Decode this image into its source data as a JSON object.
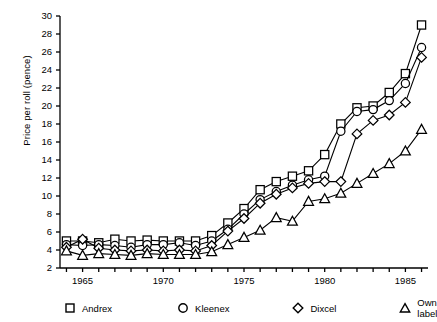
{
  "chart_data": {
    "type": "line",
    "title": "",
    "xlabel": "",
    "ylabel": "Price per roll (pence)",
    "xlim": [
      1963.6,
      1986.4
    ],
    "ylim": [
      2,
      30
    ],
    "yticks": [
      2,
      4,
      6,
      8,
      10,
      12,
      14,
      16,
      18,
      20,
      22,
      24,
      26,
      28,
      30
    ],
    "xticks": [
      1964,
      1965,
      1966,
      1967,
      1968,
      1969,
      1970,
      1971,
      1972,
      1973,
      1974,
      1975,
      1976,
      1977,
      1978,
      1979,
      1980,
      1981,
      1982,
      1983,
      1984,
      1985,
      1986
    ],
    "xtick_labels": [
      {
        "value": 1965,
        "label": "1965"
      },
      {
        "value": 1970,
        "label": "1970"
      },
      {
        "value": 1975,
        "label": "1975"
      },
      {
        "value": 1980,
        "label": "1980"
      },
      {
        "value": 1985,
        "label": "1985"
      }
    ],
    "grid": false,
    "legend_position": "below",
    "x": [
      1964,
      1965,
      1966,
      1967,
      1968,
      1969,
      1970,
      1971,
      1972,
      1973,
      1974,
      1975,
      1976,
      1977,
      1978,
      1979,
      1980,
      1981,
      1982,
      1983,
      1984,
      1985,
      1986
    ],
    "series": [
      {
        "name": "Andrex",
        "marker": "square",
        "values": [
          5.0,
          5.0,
          4.8,
          5.2,
          5.0,
          5.1,
          5.0,
          5.0,
          5.0,
          5.6,
          7.0,
          8.6,
          10.7,
          11.6,
          12.2,
          12.8,
          14.6,
          18.0,
          19.8,
          20.0,
          21.5,
          23.6,
          29.0
        ]
      },
      {
        "name": "Kleenex",
        "marker": "circle",
        "values": [
          4.6,
          4.5,
          4.6,
          4.5,
          4.3,
          4.6,
          4.6,
          4.8,
          4.5,
          5.0,
          6.3,
          8.0,
          9.6,
          10.5,
          11.2,
          11.8,
          12.2,
          17.2,
          19.4,
          19.6,
          20.6,
          22.5,
          26.5
        ]
      },
      {
        "name": "Dixcel",
        "marker": "diamond",
        "values": [
          4.3,
          5.2,
          4.2,
          4.0,
          3.9,
          4.0,
          3.9,
          4.0,
          3.9,
          4.5,
          6.1,
          7.5,
          9.2,
          10.2,
          10.9,
          11.4,
          11.6,
          11.6,
          16.9,
          18.4,
          19.0,
          20.4,
          25.4
        ]
      },
      {
        "name": "Own label",
        "marker": "triangle",
        "values": [
          3.9,
          3.4,
          3.6,
          3.5,
          3.4,
          3.6,
          3.5,
          3.5,
          3.5,
          3.8,
          4.6,
          5.4,
          6.2,
          7.6,
          7.2,
          9.4,
          9.7,
          10.3,
          11.4,
          12.5,
          13.6,
          15.0,
          17.4
        ]
      }
    ]
  },
  "legend": {
    "items": [
      {
        "label": "Andrex",
        "marker": "square"
      },
      {
        "label": "Kleenex",
        "marker": "circle"
      },
      {
        "label": "Dixcel",
        "marker": "diamond"
      },
      {
        "label": "Own label",
        "marker": "triangle"
      }
    ]
  }
}
